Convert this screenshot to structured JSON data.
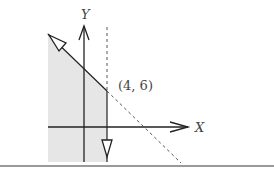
{
  "diagram": {
    "type": "linear-inequality-feasible-region",
    "axes": {
      "x_label": "X",
      "y_label": "Y"
    },
    "point_label": "(4, 6)",
    "point": {
      "x": 4,
      "y": 6
    },
    "lines": [
      {
        "name": "diagonal-boundary",
        "style": "solid-then-dashed",
        "arrow": "hollow-triangle-up-left"
      },
      {
        "name": "vertical-boundary",
        "style": "dashed-then-solid",
        "arrow": "hollow-triangle-down"
      }
    ],
    "region": {
      "name": "shaded-feasible-region",
      "fill": "#e6e6e6"
    },
    "colors": {
      "line": "#222222",
      "dashed": "#555555",
      "shade": "#e6e6e6",
      "rule": "#9a9a9a",
      "label": "#444444"
    }
  }
}
